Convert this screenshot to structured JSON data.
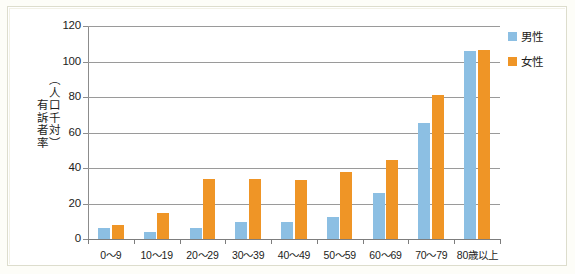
{
  "chart_data": {
    "type": "bar",
    "title": "",
    "xlabel": "",
    "ylabel": "有訴者率（人口千対）",
    "ylim": [
      0,
      120
    ],
    "yticks": [
      0,
      20,
      40,
      60,
      80,
      100,
      120
    ],
    "grid": true,
    "legend_position": "right",
    "categories": [
      "0～9",
      "10～19",
      "20～29",
      "30～39",
      "40～49",
      "50～59",
      "60～69",
      "70～79",
      "80歳以上"
    ],
    "series": [
      {
        "name": "男性",
        "color": "#8cbfe3",
        "values": [
          6,
          4,
          6,
          9.5,
          9.5,
          12.5,
          26,
          65.5,
          106
        ]
      },
      {
        "name": "女性",
        "color": "#ef9526",
        "values": [
          8,
          14.5,
          34,
          34,
          33.5,
          37.5,
          44.5,
          81,
          106.5
        ]
      }
    ]
  },
  "legend": {
    "items": [
      {
        "label": "男性",
        "color": "#8cbfe3"
      },
      {
        "label": "女性",
        "color": "#ef9526"
      }
    ]
  },
  "axis": {
    "y_title_line1": "有訴者率",
    "y_title_line2": "（人口千対）"
  }
}
